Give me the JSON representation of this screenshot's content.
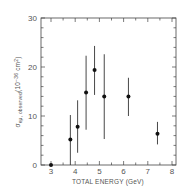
{
  "chart_data": {
    "type": "scatter",
    "title": "",
    "xlabel": "TOTAL ENERGY (GeV)",
    "ylabel": "σ_eμ, observed (10^-36 cm^2)",
    "xlim": [
      2.6,
      8.2
    ],
    "ylim": [
      0,
      30
    ],
    "xticks": [
      3,
      4,
      5,
      6,
      7,
      8
    ],
    "yticks": [
      0,
      10,
      20,
      30
    ],
    "grid": false,
    "legend": null,
    "series": [
      {
        "name": "observed eμ cross section",
        "x": [
          3.0,
          3.8,
          4.1,
          4.45,
          4.8,
          5.2,
          6.2,
          7.4
        ],
        "y": [
          0.0,
          5.2,
          7.8,
          14.8,
          19.4,
          14.0,
          14.0,
          6.4
        ],
        "err_low": [
          0.0,
          0.0,
          2.5,
          7.2,
          14.3,
          5.3,
          10.0,
          4.2
        ],
        "err_high": [
          0.0,
          10.2,
          13.2,
          22.3,
          24.3,
          22.6,
          17.8,
          8.8
        ]
      }
    ]
  },
  "labels": {
    "xlabel": "TOTAL ENERGY (GeV)",
    "ylabel_main": "σ",
    "ylabel_sub": "eμ, observed",
    "ylabel_unit_pre": "(10",
    "ylabel_exp": "−36",
    "ylabel_unit_mid": " cm",
    "ylabel_exp2": "2",
    "ylabel_unit_post": ")"
  }
}
